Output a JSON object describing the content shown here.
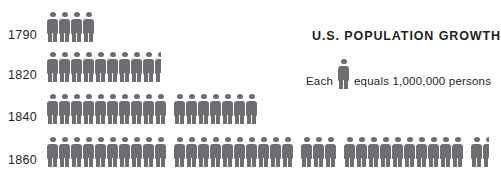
{
  "chart_data": {
    "type": "pictogram",
    "title": "U.S. POPULATION GROWTH",
    "unit_label": "Each",
    "unit_label_suffix": "equals 1,000,000 persons",
    "unit_value": 1000000,
    "icon": "person-icon",
    "icon_color": "#6d6e71",
    "text_color": "#231f20",
    "background": "#ffffff",
    "xlabel": "",
    "ylabel": "",
    "categories": [
      "1790",
      "1820",
      "1840",
      "1860"
    ],
    "values": [
      4,
      9.5,
      17,
      31.5
    ],
    "rows": [
      {
        "label": "1790",
        "icons": 4,
        "value": 4000000,
        "groups": [
          {
            "full": 4,
            "half": 0
          }
        ]
      },
      {
        "label": "1820",
        "icons": 9.5,
        "value": 9500000,
        "groups": [
          {
            "full": 9,
            "half": 1
          }
        ]
      },
      {
        "label": "1840",
        "icons": 17,
        "value": 17000000,
        "groups": [
          {
            "full": 10,
            "half": 0
          },
          {
            "full": 7,
            "half": 0
          }
        ]
      },
      {
        "label": "1860",
        "icons": 31.5,
        "value": 31500000,
        "groups": [
          {
            "full": 10,
            "half": 0
          },
          {
            "full": 10,
            "half": 0
          },
          {
            "full": 3,
            "half": 0
          },
          {
            "full": 10,
            "half": 0
          },
          {
            "full": 1,
            "half": 1
          }
        ]
      }
    ]
  },
  "legend": {
    "prefix": "Each",
    "suffix": "equals 1,000,000 persons"
  },
  "header": {
    "title": "U.S. POPULATION GROWTH"
  }
}
